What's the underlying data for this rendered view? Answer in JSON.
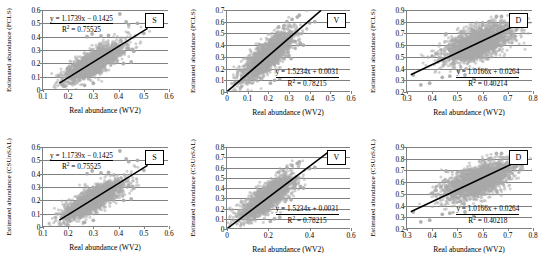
{
  "figure": {
    "rows": 2,
    "cols": 3,
    "point_color": "#a9a9a9",
    "line_color": "#000000",
    "axis_color": "#808080"
  },
  "chart_data": [
    {
      "id": "top-left",
      "type": "scatter",
      "tag": "S",
      "xlabel": "Real abundance (WV2)",
      "ylabel": "Estimated abundance (FCLS)",
      "xlim": [
        0.1,
        0.6
      ],
      "ylim": [
        0,
        0.6
      ],
      "xticks": [
        "0.1",
        "0.2",
        "0.3",
        "0.4",
        "0.5",
        "0.6"
      ],
      "xtickvals": [
        0.1,
        0.2,
        0.3,
        0.4,
        0.5,
        0.6
      ],
      "yticks": [
        "0",
        "0.1",
        "0.2",
        "0.3",
        "0.4",
        "0.5",
        "0.6"
      ],
      "ytickvals": [
        0,
        0.1,
        0.2,
        0.3,
        0.4,
        0.5,
        0.6
      ],
      "grid": true,
      "equation": "y = 1.1739x − 0.1425",
      "r2_label": "R",
      "r2_value": "= 0.75525",
      "slope": 1.1739,
      "intercept": -0.1425,
      "r2": 0.75525,
      "fit_x_range": [
        0.165,
        0.515
      ],
      "cloud": {
        "cx": 0.3,
        "cy": 0.205,
        "sx": 0.058,
        "sy": 0.072,
        "rho": 0.8,
        "n": 2200
      },
      "outliers": [
        [
          0.275,
          0.4
        ],
        [
          0.295,
          0.42
        ],
        [
          0.33,
          0.405
        ],
        [
          0.36,
          0.41
        ],
        [
          0.405,
          0.57
        ],
        [
          0.43,
          0.51
        ],
        [
          0.44,
          0.49
        ],
        [
          0.475,
          0.5
        ],
        [
          0.44,
          0.31
        ],
        [
          0.455,
          0.305
        ],
        [
          0.46,
          0.29
        ],
        [
          0.5,
          0.425
        ],
        [
          0.265,
          0.035
        ],
        [
          0.3,
          0.05
        ],
        [
          0.42,
          0.2
        ],
        [
          0.45,
          0.21
        ]
      ]
    },
    {
      "id": "top-middle",
      "type": "scatter",
      "tag": "V",
      "xlabel": "Real abundance (WV2)",
      "ylabel": "Estimated abundance (FCLS)",
      "xlim": [
        0,
        0.6
      ],
      "ylim": [
        0,
        0.7
      ],
      "xticks": [
        "0",
        "0.1",
        "0.2",
        "0.3",
        "0.4",
        "0.5",
        "0.6"
      ],
      "xtickvals": [
        0,
        0.1,
        0.2,
        0.3,
        0.4,
        0.5,
        0.6
      ],
      "yticks": [
        "0",
        "0.1",
        "0.2",
        "0.3",
        "0.4",
        "0.5",
        "0.6",
        "0.7"
      ],
      "ytickvals": [
        0,
        0.1,
        0.2,
        0.3,
        0.4,
        0.5,
        0.6,
        0.7
      ],
      "grid": true,
      "equation": "y = 1.5234x + 0.0031",
      "r2_label": "R",
      "r2_value": "= 0.78215",
      "slope": 1.5234,
      "intercept": 0.0031,
      "r2": 0.78215,
      "fit_x_range": [
        0.0,
        0.455
      ],
      "cloud": {
        "cx": 0.195,
        "cy": 0.305,
        "sx": 0.062,
        "sy": 0.105,
        "rho": 0.8,
        "n": 2200
      },
      "outliers": [
        [
          0.29,
          0.6
        ],
        [
          0.315,
          0.62
        ],
        [
          0.34,
          0.64
        ],
        [
          0.35,
          0.655
        ],
        [
          0.4,
          0.59
        ],
        [
          0.425,
          0.6
        ],
        [
          0.25,
          0.555
        ],
        [
          0.275,
          0.565
        ],
        [
          0.33,
          0.43
        ],
        [
          0.355,
          0.415
        ],
        [
          0.37,
          0.4
        ],
        [
          0.3,
          0.31
        ],
        [
          0.31,
          0.285
        ],
        [
          0.255,
          0.115
        ],
        [
          0.23,
          0.1
        ],
        [
          0.21,
          0.075
        ]
      ]
    },
    {
      "id": "top-right",
      "type": "scatter",
      "tag": "D",
      "xlabel": "Real abundance (WV2)",
      "ylabel": "Estimated abundance (FCLS)",
      "xlim": [
        0.3,
        0.8
      ],
      "ylim": [
        0.2,
        0.9
      ],
      "xticks": [
        "0.3",
        "0.4",
        "0.5",
        "0.6",
        "0.7",
        "0.8"
      ],
      "xtickvals": [
        0.3,
        0.4,
        0.5,
        0.6,
        0.7,
        0.8
      ],
      "yticks": [
        "0.2",
        "0.3",
        "0.4",
        "0.5",
        "0.6",
        "0.7",
        "0.8",
        "0.9"
      ],
      "ytickvals": [
        0.2,
        0.3,
        0.4,
        0.5,
        0.6,
        0.7,
        0.8,
        0.9
      ],
      "grid": true,
      "equation": "y = 1.0166x + 0.0264",
      "r2_label": "R",
      "r2_value": "= 0.40214",
      "slope": 1.0166,
      "intercept": 0.0264,
      "r2": 0.40214,
      "fit_x_range": [
        0.315,
        0.745
      ],
      "cloud": {
        "cx": 0.585,
        "cy": 0.615,
        "sx": 0.068,
        "sy": 0.082,
        "rho": 0.62,
        "n": 2300
      },
      "outliers": [
        [
          0.655,
          0.845
        ],
        [
          0.675,
          0.845
        ],
        [
          0.625,
          0.8
        ],
        [
          0.6,
          0.79
        ],
        [
          0.455,
          0.695
        ],
        [
          0.435,
          0.56
        ],
        [
          0.415,
          0.53
        ],
        [
          0.4,
          0.505
        ],
        [
          0.355,
          0.26
        ],
        [
          0.39,
          0.275
        ],
        [
          0.44,
          0.325
        ],
        [
          0.47,
          0.335
        ],
        [
          0.53,
          0.345
        ],
        [
          0.565,
          0.31
        ],
        [
          0.325,
          0.345
        ],
        [
          0.735,
          0.735
        ]
      ]
    },
    {
      "id": "bottom-left",
      "type": "scatter",
      "tag": "S",
      "xlabel": "Real abundance (WV2)",
      "ylabel": "Estimated abundance (CSUnSAL)",
      "xlim": [
        0.1,
        0.6
      ],
      "ylim": [
        0,
        0.6
      ],
      "xticks": [
        "0.1",
        "0.2",
        "0.3",
        "0.4",
        "0.5",
        "0.6"
      ],
      "xtickvals": [
        0.1,
        0.2,
        0.3,
        0.4,
        0.5,
        0.6
      ],
      "yticks": [
        "0",
        "0.1",
        "0.2",
        "0.3",
        "0.4",
        "0.5",
        "0.6"
      ],
      "ytickvals": [
        0,
        0.1,
        0.2,
        0.3,
        0.4,
        0.5,
        0.6
      ],
      "grid": true,
      "equation": "y = 1.1739x − 0.1425",
      "r2_label": "R",
      "r2_value": "= 0.75525",
      "slope": 1.1739,
      "intercept": -0.1425,
      "r2": 0.75525,
      "fit_x_range": [
        0.165,
        0.515
      ],
      "cloud": {
        "cx": 0.3,
        "cy": 0.205,
        "sx": 0.058,
        "sy": 0.072,
        "rho": 0.8,
        "n": 2200
      },
      "outliers": [
        [
          0.275,
          0.4
        ],
        [
          0.295,
          0.42
        ],
        [
          0.33,
          0.405
        ],
        [
          0.36,
          0.41
        ],
        [
          0.405,
          0.57
        ],
        [
          0.43,
          0.51
        ],
        [
          0.44,
          0.49
        ],
        [
          0.475,
          0.5
        ],
        [
          0.44,
          0.31
        ],
        [
          0.455,
          0.305
        ],
        [
          0.46,
          0.29
        ],
        [
          0.5,
          0.425
        ],
        [
          0.265,
          0.035
        ],
        [
          0.3,
          0.05
        ],
        [
          0.42,
          0.2
        ],
        [
          0.45,
          0.21
        ]
      ]
    },
    {
      "id": "bottom-middle",
      "type": "scatter",
      "tag": "V",
      "xlabel": "Real abundance (WV2)",
      "ylabel": "Estimated abundance (CSUnSAL)",
      "xlim": [
        0,
        0.6
      ],
      "ylim": [
        0,
        0.8
      ],
      "xticks": [
        "0",
        "0.2",
        "0.4",
        "0.6"
      ],
      "xtickvals": [
        0,
        0.2,
        0.4,
        0.6
      ],
      "yticks": [
        "0",
        "0.1",
        "0.2",
        "0.3",
        "0.4",
        "0.5",
        "0.6",
        "0.7",
        "0.8"
      ],
      "ytickvals": [
        0,
        0.1,
        0.2,
        0.3,
        0.4,
        0.5,
        0.6,
        0.7,
        0.8
      ],
      "grid": true,
      "equation": "y = 1.5234x + 0.0031",
      "r2_label": "R",
      "r2_value": "= 0.78215",
      "slope": 1.5234,
      "intercept": 0.0031,
      "r2": 0.78215,
      "fit_x_range": [
        0.0,
        0.49
      ],
      "cloud": {
        "cx": 0.195,
        "cy": 0.305,
        "sx": 0.062,
        "sy": 0.105,
        "rho": 0.8,
        "n": 2200
      },
      "outliers": [
        [
          0.29,
          0.6
        ],
        [
          0.315,
          0.62
        ],
        [
          0.34,
          0.64
        ],
        [
          0.35,
          0.655
        ],
        [
          0.4,
          0.59
        ],
        [
          0.425,
          0.6
        ],
        [
          0.25,
          0.555
        ],
        [
          0.275,
          0.565
        ],
        [
          0.33,
          0.43
        ],
        [
          0.355,
          0.415
        ],
        [
          0.37,
          0.4
        ],
        [
          0.3,
          0.31
        ],
        [
          0.31,
          0.285
        ],
        [
          0.255,
          0.115
        ],
        [
          0.23,
          0.1
        ],
        [
          0.21,
          0.075
        ]
      ]
    },
    {
      "id": "bottom-right",
      "type": "scatter",
      "tag": "D",
      "xlabel": "Real abundance (WV2)",
      "ylabel": "Estimated abundance (CSUnSAL)",
      "xlim": [
        0.3,
        0.8
      ],
      "ylim": [
        0.2,
        0.9
      ],
      "xticks": [
        "0.3",
        "0.4",
        "0.5",
        "0.6",
        "0.7",
        "0.8"
      ],
      "xtickvals": [
        0.3,
        0.4,
        0.5,
        0.6,
        0.7,
        0.8
      ],
      "yticks": [
        "0.2",
        "0.3",
        "0.4",
        "0.5",
        "0.6",
        "0.7",
        "0.8",
        "0.9"
      ],
      "ytickvals": [
        0.2,
        0.3,
        0.4,
        0.5,
        0.6,
        0.7,
        0.8,
        0.9
      ],
      "grid": true,
      "equation": "y = 1.0166x + 0.0264",
      "r2_label": "R",
      "r2_value": "= 0.40218",
      "slope": 1.0166,
      "intercept": 0.0264,
      "r2": 0.40218,
      "fit_x_range": [
        0.315,
        0.745
      ],
      "cloud": {
        "cx": 0.585,
        "cy": 0.615,
        "sx": 0.068,
        "sy": 0.082,
        "rho": 0.62,
        "n": 2300
      },
      "outliers": [
        [
          0.655,
          0.845
        ],
        [
          0.675,
          0.845
        ],
        [
          0.625,
          0.8
        ],
        [
          0.6,
          0.79
        ],
        [
          0.455,
          0.695
        ],
        [
          0.435,
          0.56
        ],
        [
          0.415,
          0.53
        ],
        [
          0.4,
          0.505
        ],
        [
          0.355,
          0.26
        ],
        [
          0.39,
          0.275
        ],
        [
          0.44,
          0.325
        ],
        [
          0.47,
          0.335
        ],
        [
          0.53,
          0.345
        ],
        [
          0.565,
          0.31
        ],
        [
          0.325,
          0.345
        ],
        [
          0.735,
          0.735
        ]
      ]
    }
  ]
}
